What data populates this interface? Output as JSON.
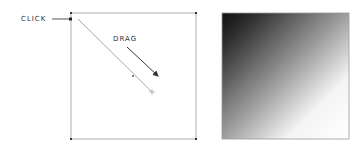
{
  "diagram": {
    "left_panel": {
      "description": "Gradient tool interaction: click at top-left, drag toward bottom-right",
      "labels": {
        "click": "CLICK",
        "drag": "DRAG"
      }
    },
    "right_panel": {
      "description": "Resulting linear gradient from black (top-left) to white (bottom-right)",
      "gradient_start_color": "#1a1a1a",
      "gradient_end_color": "#ffffff"
    },
    "colors": {
      "frame": "#888888",
      "drag_line": "#aaaaaa",
      "arrow": "#333333"
    }
  }
}
